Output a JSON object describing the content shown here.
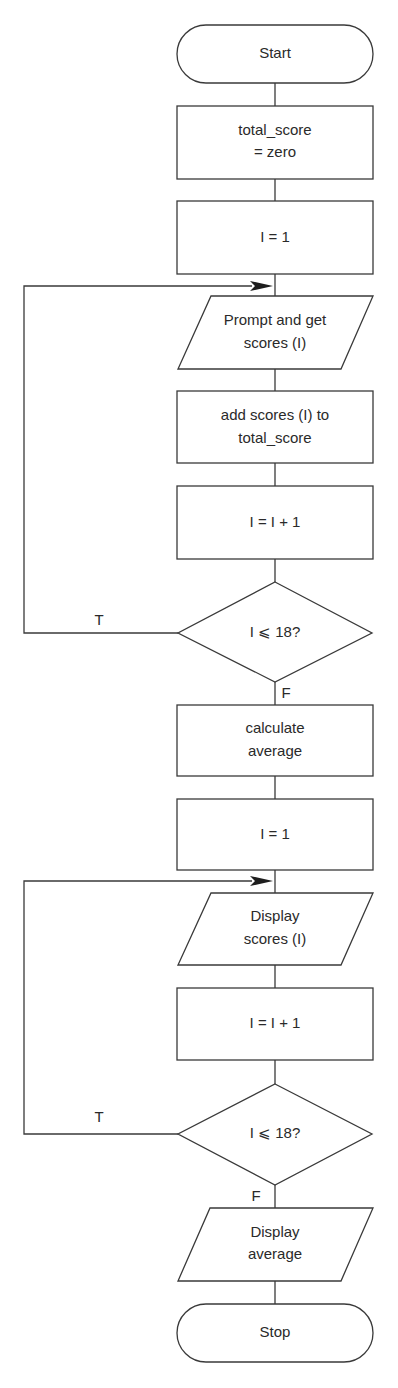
{
  "flowchart": {
    "colors": {
      "stroke": "#3a3a3a",
      "text": "#2a2a2a",
      "background": "#ffffff"
    },
    "nodes": {
      "start": {
        "type": "terminal",
        "label": "Start"
      },
      "init_total": {
        "type": "process",
        "lines": [
          "total_score",
          "= zero"
        ]
      },
      "init_i_1": {
        "type": "process",
        "label": "I = 1"
      },
      "prompt_scores": {
        "type": "input-output",
        "lines": [
          "Prompt and get",
          "scores (I)"
        ]
      },
      "add_scores": {
        "type": "process",
        "lines": [
          "add scores (I) to",
          "total_score"
        ]
      },
      "increment_1": {
        "type": "process",
        "label": "I = I + 1"
      },
      "decision_1": {
        "type": "decision",
        "label": "I ⩽ 18?"
      },
      "calc_average": {
        "type": "process",
        "lines": [
          "calculate",
          "average"
        ]
      },
      "init_i_2": {
        "type": "process",
        "label": "I = 1"
      },
      "display_scores": {
        "type": "input-output",
        "lines": [
          "Display",
          "scores (I)"
        ]
      },
      "increment_2": {
        "type": "process",
        "label": "I = I + 1"
      },
      "decision_2": {
        "type": "decision",
        "label": "I ⩽ 18?"
      },
      "display_average": {
        "type": "input-output",
        "lines": [
          "Display",
          "average"
        ]
      },
      "stop": {
        "type": "terminal",
        "label": "Stop"
      }
    },
    "branches": {
      "decision_1_true": "T",
      "decision_1_false": "F",
      "decision_2_true": "T",
      "decision_2_false": "F"
    }
  }
}
